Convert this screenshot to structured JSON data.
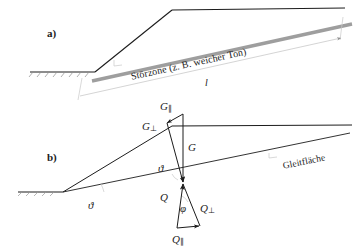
{
  "figure": {
    "width": 360,
    "height": 246,
    "background": "#ffffff",
    "line_color": "#1c1c1c",
    "band_color": "#9e9e9e",
    "thin_color": "#c9c9c9"
  },
  "panel_a": {
    "tag": "a)",
    "zone_label": "Störzone (z. B. weicher Ton)",
    "dimension_label": "l"
  },
  "panel_b": {
    "tag": "b)",
    "slip_surface_label": "Gleitfläche",
    "angle_slope_label": "ϑ",
    "angle_wedge_label": "ϑ",
    "angle_friction_label": "φ",
    "weight_vector": "G",
    "weight_parallel": "G",
    "weight_parallel_sub": "∥",
    "weight_normal": "G",
    "weight_normal_sub": "⊥",
    "force_vector": "Q",
    "force_parallel": "Q",
    "force_parallel_sub": "∥",
    "force_normal": "Q",
    "force_normal_sub": "⊥"
  }
}
